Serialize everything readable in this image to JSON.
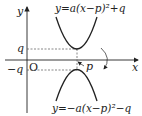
{
  "diagram": {
    "axes": {
      "x_label": "x",
      "y_label": "y",
      "origin_label": "O"
    },
    "tick_labels": {
      "q": "q",
      "neg_q": "−q",
      "p": "p"
    },
    "curves": [
      {
        "name": "upper-parabola",
        "equation": "y=a(x−p)²+q",
        "vertex": [
          "p",
          "q"
        ],
        "opens": "up"
      },
      {
        "name": "lower-parabola",
        "equation": "y=−a(x−p)²−q",
        "vertex": [
          "p",
          "−q"
        ],
        "opens": "down"
      }
    ],
    "annotation": "symmetric about x-axis (curved arrow)",
    "colors": {
      "stroke": "#222222",
      "dashed": "#555555",
      "background": "#ffffff"
    }
  }
}
